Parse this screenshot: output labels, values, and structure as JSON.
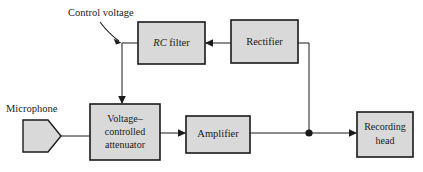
{
  "diagram": {
    "background_color": "#ffffff",
    "box_fill_color": "#d9d9d9",
    "box_stroke_color": "#1a1a1a",
    "line_color": "#1a1a1a",
    "text_color": "#1a1a1a",
    "blocks": [
      {
        "id": "rc-filter",
        "label_italic": "RC",
        "label_plain": " filter",
        "lines": [
          "RC filter"
        ]
      },
      {
        "id": "rectifier",
        "lines": [
          "Rectifier"
        ]
      },
      {
        "id": "voltage-controlled-attenuator",
        "lines": [
          "Voltage–",
          "controlled",
          "attenuator"
        ]
      },
      {
        "id": "amplifier",
        "lines": [
          "Amplifier"
        ]
      },
      {
        "id": "recording-head",
        "lines": [
          "Recording",
          "head"
        ]
      }
    ],
    "annotations": [
      {
        "id": "control-voltage",
        "text": "Control voltage"
      },
      {
        "id": "microphone",
        "text": "Microphone"
      }
    ],
    "symbols": [
      {
        "id": "microphone-symbol",
        "shape": "pentagon"
      },
      {
        "id": "junction-dot",
        "shape": "filled-circle"
      }
    ]
  }
}
